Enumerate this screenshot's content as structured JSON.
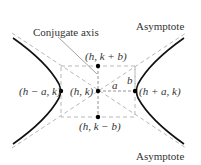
{
  "diagram": {
    "type": "hyperbola",
    "colors": {
      "curve": "#111111",
      "dashed": "#b8b8b8",
      "leader": "#8a8a8a",
      "text": "#333333",
      "points": "#000000"
    },
    "labels": {
      "conjugate_axis": "Conjugate axis",
      "asymptote_top": "Asymptote",
      "asymptote_bottom": "Asymptote",
      "center": "(h, k)",
      "vertex_left": "(h − a, k)",
      "vertex_right": "(h + a, k)",
      "covertex_top": "(h, k + b)",
      "covertex_bottom": "(h, k − b)",
      "a": "a",
      "b": "b"
    }
  }
}
